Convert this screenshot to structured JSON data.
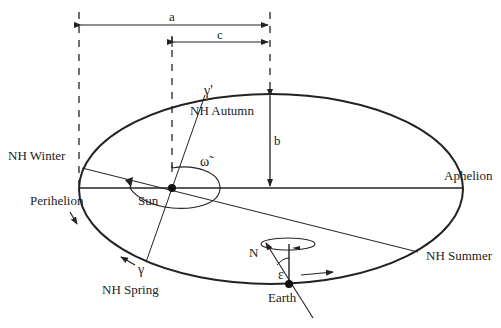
{
  "diagram": {
    "colors": {
      "line": "#222222",
      "background": "#ffffff"
    },
    "dimensions": {
      "a_label": "a",
      "c_label": "c",
      "b_label": "b"
    },
    "bodies": {
      "sun_label": "Sun",
      "earth_label": "Earth"
    },
    "orbit_points": {
      "perihelion": "Perihelion",
      "aphelion": "Aphelion",
      "nh_winter": "NH Winter",
      "nh_summer": "NH Summer",
      "nh_spring": "NH Spring",
      "nh_autumn": "NH Autumn"
    },
    "symbols": {
      "vernal_equinox": "γ",
      "autumnal_equinox": "γ'",
      "longitude_perihelion": "ω̃",
      "obliquity": "ε",
      "north": "N"
    }
  }
}
